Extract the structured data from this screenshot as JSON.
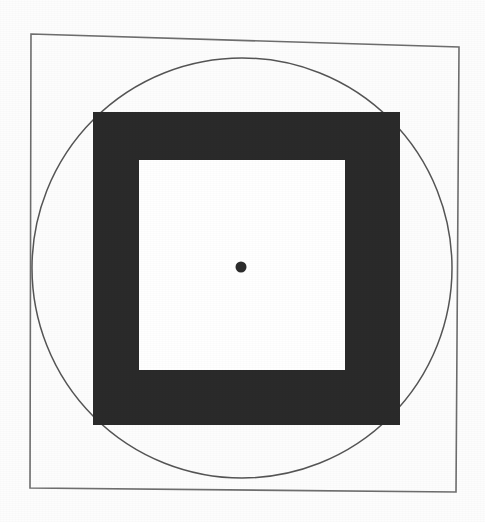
{
  "figure": {
    "canvas": {
      "width": 485,
      "height": 522,
      "background_color": "#fdfdfd"
    },
    "shapes": {
      "outer_frame": {
        "name": "outer-square-frame",
        "type": "square-outline",
        "stroke_color": "#6e6e6e",
        "stroke_width": 1.6,
        "fill": "none",
        "rotation_degrees": 1.7,
        "corners": [
          {
            "x": 31,
            "y": 34
          },
          {
            "x": 459,
            "y": 47
          },
          {
            "x": 456,
            "y": 492
          },
          {
            "x": 30,
            "y": 488
          }
        ],
        "approx_side_length": 441
      },
      "circle": {
        "name": "inscribed-circle",
        "type": "circle-outline",
        "stroke_color": "#555555",
        "stroke_width": 1.5,
        "fill": "none",
        "center_x": 242,
        "center_y": 268,
        "radius": 210,
        "leftmost_x": 32,
        "rightmost_x": 452,
        "topmost_y": 48,
        "bottommost_y": 489,
        "relationship": "inscribed in outer square; circumscribes black band square"
      },
      "black_band": {
        "name": "black-square-band",
        "type": "square-filled",
        "fill_color": "#2a2a2a",
        "x": 93,
        "y": 112,
        "width": 307,
        "height": 313,
        "band_thickness_left": 46,
        "band_thickness_top": 48,
        "band_thickness_right": 55,
        "band_thickness_bottom": 55
      },
      "inner_square": {
        "name": "inner-white-square",
        "type": "square-filled",
        "fill_color": "#ffffff",
        "x": 139,
        "y": 160,
        "width": 206,
        "height": 210
      },
      "center_dot": {
        "name": "center-dot",
        "type": "circle-filled",
        "fill_color": "#2c2c2c",
        "center_x": 241,
        "center_y": 267,
        "radius": 5.5,
        "diameter": 11
      }
    }
  },
  "chart_data": {
    "type": "diagram",
    "elements": [
      {
        "label": "outer square frame",
        "shape": "square",
        "style": "outline",
        "color": "#6e6e6e",
        "center": [
          244,
          265
        ],
        "side": 441
      },
      {
        "label": "inscribed circle",
        "shape": "circle",
        "style": "outline",
        "color": "#555555",
        "center": [
          242,
          268
        ],
        "radius": 210
      },
      {
        "label": "black square band",
        "shape": "square",
        "style": "filled",
        "color": "#2a2a2a",
        "center": [
          246,
          268
        ],
        "side": 310
      },
      {
        "label": "inner white square",
        "shape": "square",
        "style": "filled",
        "color": "#ffffff",
        "center": [
          242,
          265
        ],
        "side": 208
      },
      {
        "label": "center dot",
        "shape": "circle",
        "style": "filled",
        "color": "#2c2c2c",
        "center": [
          241,
          267
        ],
        "radius": 5.5
      }
    ],
    "grid": false,
    "legend": null,
    "xlabel": "",
    "ylabel": ""
  }
}
